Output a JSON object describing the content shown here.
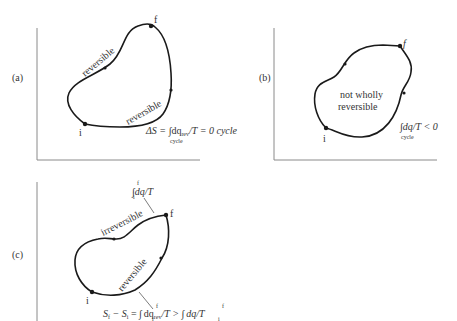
{
  "panels": {
    "a": {
      "label": "(a)",
      "path_upper": "reversible",
      "path_lower": "reversible",
      "point_initial": "i",
      "point_final": "f",
      "equation": {
        "lhs": "ΔS = ",
        "integral": "∫",
        "body": "dq",
        "body_sub": "rev",
        "rest": "/T = 0 cycle",
        "limit_below": "cycle"
      }
    },
    "b": {
      "label": "(b)",
      "center_line1": "not wholly",
      "center_line2": "reversible",
      "point_initial": "i",
      "point_final": "f",
      "equation": {
        "integral": "∫",
        "body": "dq/T < 0",
        "limit_below": "cycle"
      }
    },
    "c": {
      "label": "(c)",
      "path_upper": "irreversible",
      "path_lower": "reversible",
      "point_initial": "i",
      "point_final": "f",
      "upper_annotation": {
        "integral": "∫",
        "lim_top": "f",
        "lim_bot": "i",
        "body": "dq/T"
      },
      "bottom_equation": {
        "lhs": "S",
        "lhs_sub_f": "f",
        "minus": " − S",
        "lhs_sub_i": "i",
        "eq": " = ",
        "integral1": "∫",
        "lim1_top": "f",
        "lim1_bot": "i",
        "body1": "dq",
        "body1_sub": "rev",
        "mid": "/T > ",
        "integral2": "∫",
        "lim2_top": "f",
        "lim2_bot": "i",
        "body2": "dq/T"
      }
    }
  }
}
